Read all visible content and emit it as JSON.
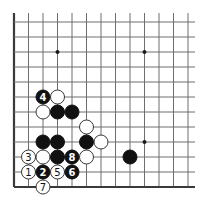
{
  "diagram": {
    "type": "go-board-diagram",
    "board": {
      "columns_visible": 13,
      "rows_visible": 12,
      "edges": [
        "left",
        "bottom"
      ],
      "origin_x": 14,
      "origin_y": 22,
      "col_spacing": 14.5,
      "row_spacing": 15,
      "line_extend_right": 195,
      "line_extend_top": 13,
      "stone_radius": 7
    },
    "colors": {
      "background": "#ffffff",
      "grid": "#6e6e6e",
      "edge": "#3a3a3a",
      "black_stone": "#111111",
      "white_stone": "#ffffff"
    },
    "star_points": [
      {
        "col": 3,
        "row": 2
      },
      {
        "col": 9,
        "row": 2
      },
      {
        "col": 9,
        "row": 8
      }
    ],
    "stones": [
      {
        "color": "black",
        "col": 2,
        "row": 5,
        "label": "4"
      },
      {
        "color": "white",
        "col": 3,
        "row": 5,
        "label": ""
      },
      {
        "color": "white",
        "col": 2,
        "row": 6,
        "label": ""
      },
      {
        "color": "black",
        "col": 3,
        "row": 6,
        "label": ""
      },
      {
        "color": "black",
        "col": 4,
        "row": 6,
        "label": ""
      },
      {
        "color": "white",
        "col": 5,
        "row": 7,
        "label": ""
      },
      {
        "color": "black",
        "col": 2,
        "row": 8,
        "label": ""
      },
      {
        "color": "black",
        "col": 3,
        "row": 8,
        "label": ""
      },
      {
        "color": "black",
        "col": 5,
        "row": 8,
        "label": ""
      },
      {
        "color": "white",
        "col": 6,
        "row": 8,
        "label": ""
      },
      {
        "color": "white",
        "col": 1,
        "row": 9,
        "label": "3"
      },
      {
        "color": "white",
        "col": 2,
        "row": 9,
        "label": ""
      },
      {
        "color": "black",
        "col": 3,
        "row": 9,
        "label": ""
      },
      {
        "color": "black",
        "col": 4,
        "row": 9,
        "label": "8"
      },
      {
        "color": "white",
        "col": 5,
        "row": 9,
        "label": ""
      },
      {
        "color": "black",
        "col": 8,
        "row": 9,
        "label": ""
      },
      {
        "color": "white",
        "col": 1,
        "row": 10,
        "label": "1"
      },
      {
        "color": "black",
        "col": 2,
        "row": 10,
        "label": "2"
      },
      {
        "color": "white",
        "col": 3,
        "row": 10,
        "label": "5"
      },
      {
        "color": "black",
        "col": 4,
        "row": 10,
        "label": "6"
      },
      {
        "color": "white",
        "col": 2,
        "row": 11,
        "label": "7"
      }
    ]
  }
}
